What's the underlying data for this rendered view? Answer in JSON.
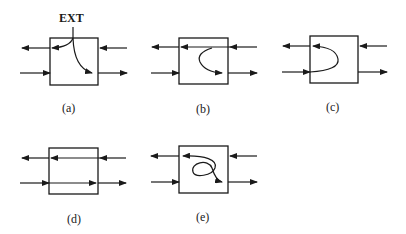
{
  "figure": {
    "annotation": "EXT",
    "panels": [
      {
        "id": "a",
        "label": "(a)",
        "description": "EXT input splits into left-going and right-going outputs"
      },
      {
        "id": "b",
        "label": "(b)",
        "description": "upper left-going line passes through; right-going curve from upper to lower"
      },
      {
        "id": "c",
        "label": "(c)",
        "description": "lower right-going input loops back to upper left-going output"
      },
      {
        "id": "d",
        "label": "(d)",
        "description": "both lines pass straight through"
      },
      {
        "id": "e",
        "label": "(e)",
        "description": "S-shaped crossing loop between upper and lower lines"
      }
    ]
  },
  "colors": {
    "stroke": "#1a1a1a",
    "background": "#ffffff"
  }
}
